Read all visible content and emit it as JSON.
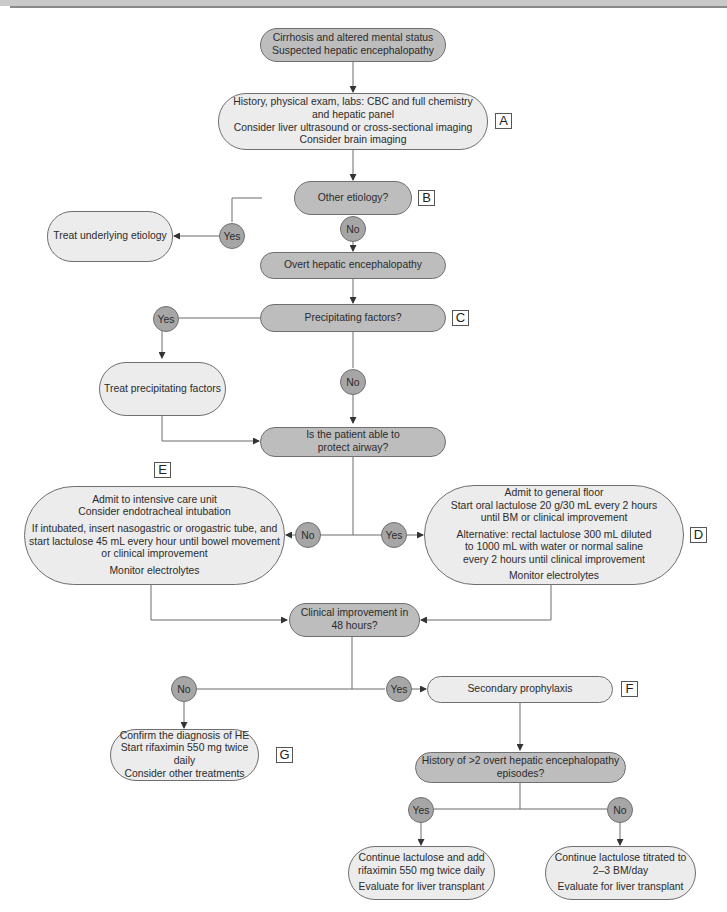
{
  "nodes": {
    "start": {
      "lines": [
        "Cirrhosis and altered mental status",
        "Suspected hepatic encephalopathy"
      ]
    },
    "workup": {
      "lines": [
        "History, physical exam, labs: CBC and full chemistry",
        "and hepatic panel",
        "Consider liver ultrasound or cross-sectional imaging",
        "Consider brain imaging"
      ]
    },
    "other_etiology": {
      "text": "Other etiology?"
    },
    "treat_underlying": {
      "text": "Treat underlying etiology"
    },
    "overt_he": {
      "text": "Overt hepatic encephalopathy"
    },
    "precipitating": {
      "text": "Precipitating factors?"
    },
    "treat_precipitating": {
      "text": "Treat precipitating factors"
    },
    "airway": {
      "lines": [
        "Is the patient able to",
        "protect airway?"
      ]
    },
    "icu": {
      "lines": [
        "Admit to intensive care unit",
        "Consider endotracheal intubation"
      ],
      "lines2": [
        "If intubated, insert nasogastric or orogastric tube, and",
        "start lactulose 45 mL every hour until bowel movement",
        "or clinical improvement"
      ],
      "lines3": [
        "Monitor electrolytes"
      ]
    },
    "floor": {
      "lines": [
        "Admit to general floor",
        "Start oral lactulose 20 g/30 mL every 2 hours",
        "until BM or clinical improvement"
      ],
      "lines2": [
        "Alternative: rectal lactulose 300 mL diluted",
        "to 1000 mL with water or normal saline",
        "every 2 hours until clinical improvement"
      ],
      "lines3": [
        "Monitor electrolytes"
      ]
    },
    "improvement": {
      "lines": [
        "Clinical improvement in",
        "48 hours?"
      ]
    },
    "confirm": {
      "lines": [
        "Confirm the diagnosis of HE",
        "Start rifaximin 550 mg twice daily",
        "Consider other treatments"
      ]
    },
    "secondary": {
      "text": "Secondary prophylaxis"
    },
    "history": {
      "lines": [
        "History of >2 overt hepatic encephalopathy",
        "episodes?"
      ]
    },
    "add_rifaximin": {
      "lines": [
        "Continue lactulose and add",
        "rifaximin 550 mg twice daily"
      ],
      "lines2": [
        "Evaluate for liver transplant"
      ]
    },
    "titrate": {
      "lines": [
        "Continue lactulose titrated to",
        "2–3 BM/day"
      ],
      "lines2": [
        "Evaluate for liver transplant"
      ]
    }
  },
  "decisions": {
    "b_yes": "Yes",
    "b_no": "No",
    "c_yes": "Yes",
    "c_no": "No",
    "airway_no": "No",
    "airway_yes": "Yes",
    "improve_no": "No",
    "improve_yes": "Yes",
    "history_yes": "Yes",
    "history_no": "No"
  },
  "tags": {
    "a": "A",
    "b": "B",
    "c": "C",
    "d": "D",
    "e": "E",
    "f": "F",
    "g": "G"
  },
  "colors": {
    "decision_fill": "#bdbdbd",
    "action_fill": "#ececec",
    "circle_fill": "#a6a6a6",
    "stroke": "#6f6f6f"
  }
}
